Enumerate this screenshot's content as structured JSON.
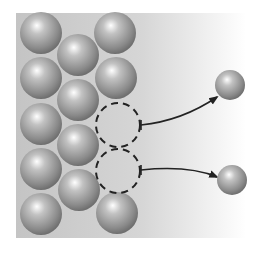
{
  "diagram": {
    "title": "",
    "canvas": {
      "width": 261,
      "height": 253
    },
    "background_panel": {
      "x": 16,
      "y": 13,
      "width": 230,
      "height": 225,
      "color_left": "#c4c4c4",
      "color_right": "#ffffff"
    },
    "colors": {
      "sphere_dark": "#6f6f6f",
      "sphere_mid": "#a8a8a8",
      "sphere_highlight": "#ffffff",
      "vacancy_stroke": "#222222",
      "arrow": "#222222"
    },
    "lattice_atoms": [
      {
        "cx": 41,
        "cy": 33,
        "r": 21
      },
      {
        "cx": 41,
        "cy": 78,
        "r": 21
      },
      {
        "cx": 41,
        "cy": 124,
        "r": 21
      },
      {
        "cx": 41,
        "cy": 169,
        "r": 21
      },
      {
        "cx": 41,
        "cy": 214,
        "r": 21
      },
      {
        "cx": 78,
        "cy": 55,
        "r": 21
      },
      {
        "cx": 78,
        "cy": 100,
        "r": 21
      },
      {
        "cx": 78,
        "cy": 145,
        "r": 21
      },
      {
        "cx": 79,
        "cy": 190,
        "r": 21
      },
      {
        "cx": 115,
        "cy": 33,
        "r": 21
      },
      {
        "cx": 116,
        "cy": 78,
        "r": 21
      },
      {
        "cx": 117,
        "cy": 213,
        "r": 21
      }
    ],
    "vacancies": [
      {
        "cx": 118,
        "cy": 125,
        "r": 22
      },
      {
        "cx": 118,
        "cy": 171,
        "r": 22
      }
    ],
    "ejected_atoms": [
      {
        "cx": 230,
        "cy": 85,
        "r": 15
      },
      {
        "cx": 232,
        "cy": 180,
        "r": 15
      }
    ],
    "arrows": [
      {
        "path": "M141,125 C170,122 195,112 217,97",
        "tick": {
          "x": 141,
          "y1": 120,
          "y2": 130
        }
      },
      {
        "path": "M141,170 C170,167 198,169 217,177",
        "tick": {
          "x": 141,
          "y1": 165,
          "y2": 175
        }
      }
    ]
  }
}
